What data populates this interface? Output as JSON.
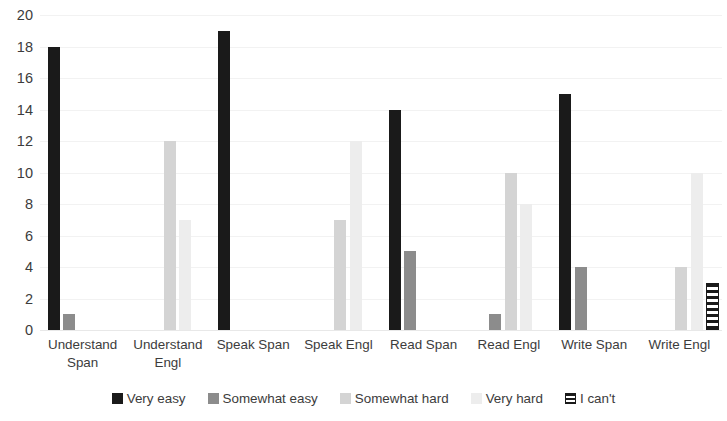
{
  "chart_data": {
    "type": "bar",
    "title": "",
    "subtitle": "",
    "xlabel": "",
    "ylabel": "",
    "ylim": [
      0,
      20
    ],
    "ytick_step": 2,
    "yticks": [
      20,
      18,
      16,
      14,
      12,
      10,
      8,
      6,
      4,
      2,
      0
    ],
    "grid": true,
    "grid_axis": "y",
    "legend_position": "bottom",
    "categories": [
      "Understand Span",
      "Understand Engl",
      "Speak Span",
      "Speak Engl",
      "Read Span",
      "Read Engl",
      "Write Span",
      "Write Engl"
    ],
    "category_lines": [
      [
        "Understand",
        "Span"
      ],
      [
        "Understand",
        "Engl"
      ],
      [
        "Speak Span"
      ],
      [
        "Speak Engl"
      ],
      [
        "Read Span"
      ],
      [
        "Read Engl"
      ],
      [
        "Write Span"
      ],
      [
        "Write Engl"
      ]
    ],
    "series": [
      {
        "name": "Very easy",
        "color": "#1a1a1a",
        "pattern": "solid",
        "values": [
          18,
          0,
          19,
          0,
          14,
          0,
          15,
          0
        ]
      },
      {
        "name": "Somewhat easy",
        "color": "#8c8c8c",
        "pattern": "solid",
        "values": [
          1,
          0,
          0,
          0,
          5,
          1,
          4,
          0
        ]
      },
      {
        "name": "Somewhat hard",
        "color": "#d4d4d4",
        "pattern": "solid",
        "values": [
          0,
          12,
          0,
          7,
          0,
          10,
          0,
          4
        ]
      },
      {
        "name": "Very hard",
        "color": "#ededed",
        "pattern": "solid",
        "values": [
          0,
          7,
          0,
          12,
          0,
          8,
          0,
          10
        ]
      },
      {
        "name": "I can't",
        "color": "#1a1a1a",
        "pattern": "horizontal-stripes",
        "values": [
          0,
          0,
          0,
          0,
          0,
          0,
          0,
          3
        ]
      }
    ]
  },
  "legend": {
    "items": [
      {
        "label": "Very easy",
        "swatch": "legend-swatch-very-easy"
      },
      {
        "label": "Somewhat easy",
        "swatch": "legend-swatch-somewhat-easy"
      },
      {
        "label": "Somewhat hard",
        "swatch": "legend-swatch-somewhat-hard"
      },
      {
        "label": "Very hard",
        "swatch": "legend-swatch-very-hard"
      },
      {
        "label": "I can't",
        "swatch": "legend-swatch-i-cant"
      }
    ]
  },
  "colors": {
    "very_easy": "#1a1a1a",
    "somewhat_easy": "#8c8c8c",
    "somewhat_hard": "#d4d4d4",
    "very_hard": "#ededed",
    "i_cant_stripe": "#1a1a1a",
    "gridline": "#f2f2f2",
    "text": "#3c3c3c",
    "background": "#ffffff"
  }
}
